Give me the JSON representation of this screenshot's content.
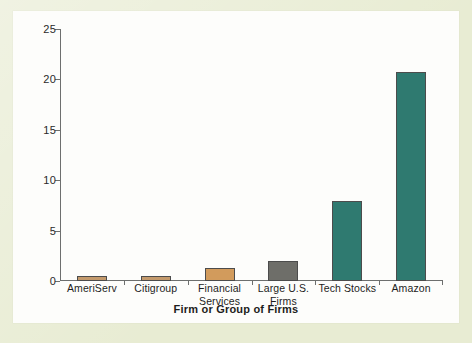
{
  "chart_data": {
    "type": "bar",
    "title": "",
    "xlabel": "Firm or Group of Firms",
    "ylabel": "Market-to-Book Ratio",
    "categories": [
      "AmeriServ",
      "Citigroup",
      "Financial\nServices",
      "Large U.S.\nFirms",
      "Tech Stocks",
      "Amazon"
    ],
    "values": [
      0.5,
      0.5,
      1.3,
      2.0,
      7.9,
      20.7
    ],
    "bar_colors": [
      "#C49A6C",
      "#C49A6C",
      "#D29B5C",
      "#6E6E69",
      "#2F7A70",
      "#2F7A70"
    ],
    "ylim": [
      0,
      25
    ],
    "yticks": [
      0,
      5,
      10,
      15,
      20,
      25
    ],
    "ytick_labels": [
      "0",
      "5",
      "10",
      "15",
      "20",
      "25"
    ],
    "grid": false,
    "legend": "none"
  },
  "figure": {
    "mat_color": "#E8ECD3",
    "card_color": "#FDFDFB",
    "axis_color": "#6D6F6E",
    "bar_outline": "#4C4C4C"
  }
}
